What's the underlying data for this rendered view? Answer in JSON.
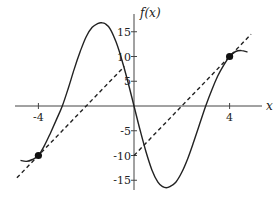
{
  "chart_data": {
    "type": "line",
    "title": "",
    "xlabel": "x",
    "ylabel": "f(x)",
    "xlim": [
      -4.9,
      4.9
    ],
    "ylim": [
      -17,
      17
    ],
    "grid": false,
    "legend": null,
    "x_ticks": [
      {
        "value": -4,
        "label": "-4"
      },
      {
        "value": 4,
        "label": "4"
      }
    ],
    "y_ticks": [
      {
        "value": 15,
        "label": "15"
      },
      {
        "value": 10,
        "label": "10"
      },
      {
        "value": 5,
        "label": "5"
      },
      {
        "value": -5,
        "label": "-5"
      },
      {
        "value": -10,
        "label": "-10"
      },
      {
        "value": -15,
        "label": "-15"
      }
    ],
    "series": [
      {
        "name": "f(x)",
        "style": "solid",
        "color": "#222222",
        "points": [
          [
            -4.75,
            -11.0
          ],
          [
            -4.5,
            -11.2
          ],
          [
            -4.25,
            -10.8
          ],
          [
            -4.0,
            -10.0
          ],
          [
            -3.75,
            -8.0
          ],
          [
            -3.5,
            -5.5
          ],
          [
            -3.25,
            -2.8
          ],
          [
            -3.0,
            0.0
          ],
          [
            -2.75,
            3.6
          ],
          [
            -2.5,
            7.5
          ],
          [
            -2.25,
            11.0
          ],
          [
            -2.0,
            14.0
          ],
          [
            -1.75,
            15.9
          ],
          [
            -1.5,
            16.7
          ],
          [
            -1.35,
            16.8
          ],
          [
            -1.2,
            16.6
          ],
          [
            -1.0,
            15.6
          ],
          [
            -0.75,
            12.9
          ],
          [
            -0.5,
            9.2
          ],
          [
            -0.25,
            4.8
          ],
          [
            0.0,
            0.0
          ],
          [
            0.25,
            -4.8
          ],
          [
            0.5,
            -9.2
          ],
          [
            0.75,
            -12.9
          ],
          [
            1.0,
            -15.4
          ],
          [
            1.2,
            -16.3
          ],
          [
            1.35,
            -16.5
          ],
          [
            1.5,
            -16.3
          ],
          [
            1.75,
            -15.4
          ],
          [
            2.0,
            -13.4
          ],
          [
            2.25,
            -10.6
          ],
          [
            2.5,
            -7.2
          ],
          [
            2.75,
            -3.6
          ],
          [
            3.0,
            0.0
          ],
          [
            3.25,
            3.2
          ],
          [
            3.5,
            6.0
          ],
          [
            3.75,
            8.2
          ],
          [
            4.0,
            10.0
          ],
          [
            4.25,
            11.0
          ],
          [
            4.5,
            11.2
          ],
          [
            4.75,
            10.9
          ]
        ]
      },
      {
        "name": "secant-left",
        "style": "dashed",
        "color": "#222222",
        "points": [
          [
            -4.9,
            -14.5
          ],
          [
            -0.4,
            8.0
          ]
        ]
      },
      {
        "name": "secant-right",
        "style": "dashed",
        "color": "#222222",
        "points": [
          [
            0.0,
            -10.0
          ],
          [
            4.9,
            14.5
          ]
        ]
      }
    ],
    "marked_points": [
      {
        "x": -4,
        "y": -10
      },
      {
        "x": 4,
        "y": 10
      }
    ],
    "layout": {
      "origin_px": [
        134,
        106
      ],
      "x_unit_px": 23.9,
      "y_unit_px": 4.95,
      "x_axis_px": [
        15,
        262
      ],
      "y_axis_px": [
        14,
        190
      ]
    }
  }
}
